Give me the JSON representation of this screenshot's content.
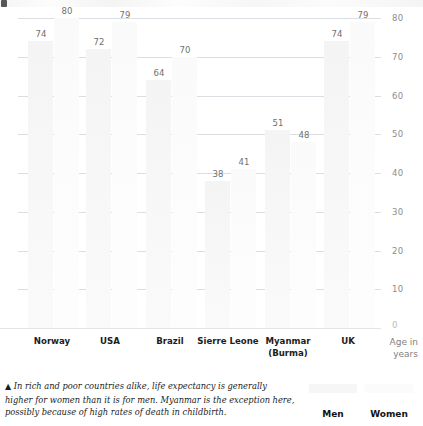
{
  "chart_data": {
    "type": "bar",
    "title": "",
    "subtitle": "",
    "xlabel": "",
    "ylabel": "Age in years",
    "ylim": [
      0,
      80
    ],
    "yticks": [
      0,
      10,
      20,
      30,
      40,
      50,
      60,
      70,
      80
    ],
    "grid": true,
    "legend_position": "bottom-right",
    "categories": [
      "Norway",
      "USA",
      "Brazil",
      "Sierre Leone",
      "Myanmar\n(Burma)",
      "UK"
    ],
    "series": [
      {
        "name": "Men",
        "color": "#f6f6f7",
        "values": [
          74,
          72,
          64,
          38,
          51,
          74
        ]
      },
      {
        "name": "Women",
        "color": "#fbfbfc",
        "values": [
          80,
          79,
          70,
          41,
          48,
          79
        ]
      }
    ],
    "annotation": "In rich and poor countries alike, life expectancy is generally higher for women than it is for men. Myanmar is the exception here, possibly because of high rates of death in childbirth."
  },
  "axis": {
    "y_title_line1": "Age in",
    "y_title_line2": "years",
    "tick_labels": [
      "80",
      "70",
      "60",
      "50",
      "40",
      "30",
      "20",
      "10",
      "0"
    ],
    "zero_label": "0"
  },
  "x_categories": [
    {
      "line1": "Norway",
      "line2": ""
    },
    {
      "line1": "USA",
      "line2": ""
    },
    {
      "line1": "Brazil",
      "line2": ""
    },
    {
      "line1": "Sierre Leone",
      "line2": ""
    },
    {
      "line1": "Myanmar",
      "line2": "(Burma)"
    },
    {
      "line1": "UK",
      "line2": ""
    }
  ],
  "bar_labels": {
    "men": [
      "74",
      "72",
      "64",
      "38",
      "51",
      "74"
    ],
    "women": [
      "80",
      "79",
      "70",
      "41",
      "48",
      "79"
    ]
  },
  "legend": {
    "items": [
      {
        "label": "Men",
        "swatch": "men-swatch"
      },
      {
        "label": "Women",
        "swatch": "women-swatch"
      }
    ]
  },
  "caption": {
    "marker": "▲",
    "text": "In rich and poor countries alike, life expectancy is generally higher for women than it is for men. Myanmar is the exception here, possibly because of high rates of death in childbirth."
  }
}
